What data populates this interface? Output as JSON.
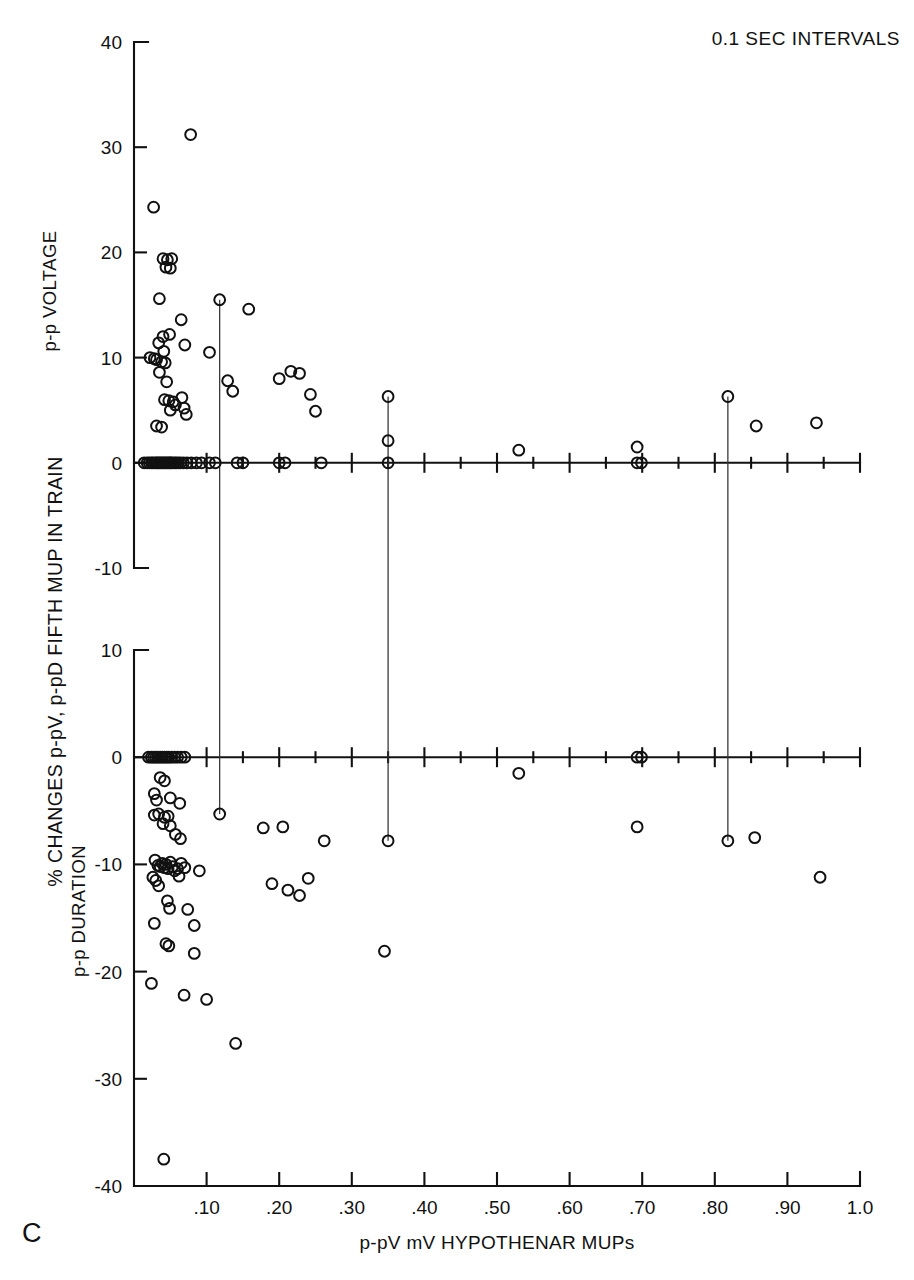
{
  "figure": {
    "title": "0.1 SEC INTERVALS",
    "panel_letter": "C",
    "y_axis_label": "% CHANGES p-pV, p-pD FIFTH MUP IN TRAIN",
    "x_axis_label": "p-pV mV HYPOTHENAR MUPs"
  },
  "chart_data": {
    "type": "scatter",
    "title": "0.1 SEC INTERVALS",
    "xlabel": "p-pV mV HYPOTHENAR MUPs",
    "ylabel": "% CHANGES p-pV, p-pD FIFTH MUP IN TRAIN",
    "xlim": [
      0.0,
      1.0
    ],
    "xticks": [
      0.1,
      0.2,
      0.3,
      0.4,
      0.5,
      0.6,
      0.7,
      0.8,
      0.9,
      1.0
    ],
    "xticklabels": [
      ".10",
      ".20",
      ".30",
      ".40",
      ".50",
      ".60",
      ".70",
      ".80",
      ".90",
      "1.0"
    ],
    "xminorticks": [
      0.05,
      0.15,
      0.25,
      0.35,
      0.45,
      0.55,
      0.65,
      0.75,
      0.85,
      0.95
    ],
    "grid": false,
    "legend": false,
    "panels": [
      {
        "name": "p-p VOLTAGE",
        "ylabel": "p-p VOLTAGE",
        "ylim": [
          -10,
          40
        ],
        "yticks": [
          -10,
          0,
          10,
          20,
          30,
          40
        ],
        "yticklabels": [
          "-10",
          "0",
          "10",
          "20",
          "30",
          "40"
        ],
        "points": [
          [
            0.078,
            31.2
          ],
          [
            0.027,
            24.3
          ],
          [
            0.04,
            19.4
          ],
          [
            0.046,
            19.3
          ],
          [
            0.052,
            19.4
          ],
          [
            0.044,
            18.6
          ],
          [
            0.05,
            18.5
          ],
          [
            0.035,
            15.6
          ],
          [
            0.118,
            15.5
          ],
          [
            0.158,
            14.6
          ],
          [
            0.065,
            13.6
          ],
          [
            0.04,
            12.0
          ],
          [
            0.049,
            12.2
          ],
          [
            0.034,
            11.4
          ],
          [
            0.07,
            11.2
          ],
          [
            0.041,
            10.6
          ],
          [
            0.104,
            10.5
          ],
          [
            0.022,
            10.0
          ],
          [
            0.028,
            9.9
          ],
          [
            0.031,
            9.8
          ],
          [
            0.038,
            9.6
          ],
          [
            0.043,
            9.5
          ],
          [
            0.035,
            8.6
          ],
          [
            0.129,
            7.8
          ],
          [
            0.045,
            7.7
          ],
          [
            0.2,
            8.0
          ],
          [
            0.216,
            8.7
          ],
          [
            0.228,
            8.5
          ],
          [
            0.042,
            6.0
          ],
          [
            0.048,
            5.9
          ],
          [
            0.054,
            5.8
          ],
          [
            0.057,
            5.5
          ],
          [
            0.05,
            5.0
          ],
          [
            0.066,
            6.2
          ],
          [
            0.069,
            5.2
          ],
          [
            0.072,
            4.6
          ],
          [
            0.243,
            6.5
          ],
          [
            0.35,
            6.3
          ],
          [
            0.818,
            6.3
          ],
          [
            0.136,
            6.8
          ],
          [
            0.25,
            4.9
          ],
          [
            0.031,
            3.5
          ],
          [
            0.038,
            3.4
          ],
          [
            0.35,
            2.1
          ],
          [
            0.53,
            1.2
          ],
          [
            0.693,
            1.5
          ],
          [
            0.857,
            3.5
          ],
          [
            0.94,
            3.8
          ],
          [
            0.014,
            0.0
          ],
          [
            0.018,
            0.0
          ],
          [
            0.021,
            0.0
          ],
          [
            0.024,
            0.0
          ],
          [
            0.026,
            0.0
          ],
          [
            0.029,
            0.0
          ],
          [
            0.031,
            0.0
          ],
          [
            0.033,
            0.0
          ],
          [
            0.035,
            0.0
          ],
          [
            0.037,
            0.0
          ],
          [
            0.039,
            0.0
          ],
          [
            0.041,
            0.0
          ],
          [
            0.043,
            0.0
          ],
          [
            0.045,
            0.0
          ],
          [
            0.047,
            0.0
          ],
          [
            0.049,
            0.0
          ],
          [
            0.051,
            0.0
          ],
          [
            0.053,
            0.0
          ],
          [
            0.056,
            0.0
          ],
          [
            0.058,
            0.0
          ],
          [
            0.061,
            0.0
          ],
          [
            0.064,
            0.0
          ],
          [
            0.068,
            0.0
          ],
          [
            0.073,
            0.0
          ],
          [
            0.079,
            0.0
          ],
          [
            0.086,
            0.0
          ],
          [
            0.093,
            0.0
          ],
          [
            0.104,
            0.0
          ],
          [
            0.112,
            0.0
          ],
          [
            0.142,
            0.0
          ],
          [
            0.15,
            0.0
          ],
          [
            0.2,
            0.0
          ],
          [
            0.208,
            0.0
          ],
          [
            0.258,
            0.0
          ],
          [
            0.35,
            0.0
          ],
          [
            0.693,
            0.0
          ],
          [
            0.699,
            0.0
          ]
        ]
      },
      {
        "name": "p-p DURATION",
        "ylabel": "p-p DURATION",
        "ylim": [
          -40,
          10
        ],
        "yticks": [
          -40,
          -30,
          -20,
          -10,
          0,
          10
        ],
        "yticklabels": [
          "-40",
          "-30",
          "-20",
          "-10",
          "0",
          "10"
        ],
        "points": [
          [
            0.02,
            0.0
          ],
          [
            0.024,
            0.0
          ],
          [
            0.027,
            0.0
          ],
          [
            0.03,
            0.0
          ],
          [
            0.033,
            0.0
          ],
          [
            0.036,
            0.0
          ],
          [
            0.039,
            0.0
          ],
          [
            0.042,
            0.0
          ],
          [
            0.045,
            0.0
          ],
          [
            0.048,
            0.0
          ],
          [
            0.052,
            0.0
          ],
          [
            0.056,
            0.0
          ],
          [
            0.06,
            0.0
          ],
          [
            0.065,
            0.0
          ],
          [
            0.07,
            0.0
          ],
          [
            0.693,
            0.0
          ],
          [
            0.699,
            0.0
          ],
          [
            0.036,
            -1.9
          ],
          [
            0.042,
            -2.2
          ],
          [
            0.53,
            -1.5
          ],
          [
            0.028,
            -3.4
          ],
          [
            0.031,
            -4.0
          ],
          [
            0.05,
            -3.8
          ],
          [
            0.063,
            -4.3
          ],
          [
            0.028,
            -5.4
          ],
          [
            0.034,
            -5.3
          ],
          [
            0.042,
            -5.6
          ],
          [
            0.047,
            -5.5
          ],
          [
            0.04,
            -6.2
          ],
          [
            0.05,
            -6.4
          ],
          [
            0.118,
            -5.3
          ],
          [
            0.178,
            -6.6
          ],
          [
            0.205,
            -6.5
          ],
          [
            0.262,
            -7.8
          ],
          [
            0.35,
            -7.8
          ],
          [
            0.818,
            -7.8
          ],
          [
            0.855,
            -7.5
          ],
          [
            0.693,
            -6.5
          ],
          [
            0.057,
            -7.2
          ],
          [
            0.064,
            -7.6
          ],
          [
            0.029,
            -9.6
          ],
          [
            0.033,
            -10.1
          ],
          [
            0.036,
            -10.2
          ],
          [
            0.039,
            -9.9
          ],
          [
            0.042,
            -10.3
          ],
          [
            0.044,
            -10.0
          ],
          [
            0.047,
            -10.4
          ],
          [
            0.05,
            -9.8
          ],
          [
            0.053,
            -10.2
          ],
          [
            0.056,
            -10.6
          ],
          [
            0.026,
            -11.2
          ],
          [
            0.03,
            -11.5
          ],
          [
            0.06,
            -10.4
          ],
          [
            0.065,
            -9.9
          ],
          [
            0.07,
            -10.3
          ],
          [
            0.034,
            -12.0
          ],
          [
            0.062,
            -11.1
          ],
          [
            0.09,
            -10.6
          ],
          [
            0.212,
            -12.4
          ],
          [
            0.228,
            -12.9
          ],
          [
            0.24,
            -11.3
          ],
          [
            0.19,
            -11.8
          ],
          [
            0.046,
            -13.4
          ],
          [
            0.049,
            -14.1
          ],
          [
            0.074,
            -14.2
          ],
          [
            0.028,
            -15.5
          ],
          [
            0.083,
            -15.7
          ],
          [
            0.044,
            -17.4
          ],
          [
            0.048,
            -17.6
          ],
          [
            0.083,
            -18.3
          ],
          [
            0.345,
            -18.1
          ],
          [
            0.024,
            -21.1
          ],
          [
            0.069,
            -22.2
          ],
          [
            0.945,
            -11.2
          ],
          [
            0.1,
            -22.6
          ],
          [
            0.14,
            -26.7
          ],
          [
            0.041,
            -37.5
          ]
        ]
      }
    ],
    "connectors": [
      {
        "x": 0.118,
        "from_panel": "p-p VOLTAGE",
        "from_y": 15.5,
        "to_panel": "p-p DURATION",
        "to_y": -5.3
      },
      {
        "x": 0.35,
        "from_panel": "p-p VOLTAGE",
        "from_y": 6.3,
        "to_panel": "p-p DURATION",
        "to_y": -7.8
      },
      {
        "x": 0.818,
        "from_panel": "p-p VOLTAGE",
        "from_y": 6.3,
        "to_panel": "p-p DURATION",
        "to_y": -7.8
      }
    ]
  }
}
